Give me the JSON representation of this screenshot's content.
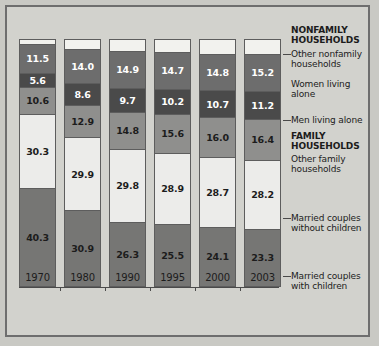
{
  "chart_data": {
    "type": "bar",
    "stacked": true,
    "title": "",
    "subtitle": "",
    "xlabel": "",
    "ylabel": "",
    "ylim": [
      0,
      100
    ],
    "grid": false,
    "legend_position": "right",
    "categories": [
      "1970",
      "1980",
      "1990",
      "1995",
      "2000",
      "2003"
    ],
    "top_labels": [
      "1.7",
      "3.6",
      "4.6",
      "5.0",
      "5.7",
      "5.6"
    ],
    "series": [
      {
        "name": "Married couples with children",
        "group": "FAMILY HOUSEHOLDS",
        "color": "#767674",
        "values": [
          40.3,
          30.9,
          26.3,
          25.5,
          24.1,
          23.3
        ],
        "labels": [
          "40.3",
          "30.9",
          "26.3",
          "25.5",
          "24.1",
          "23.3"
        ]
      },
      {
        "name": "Married couples without children",
        "group": "FAMILY HOUSEHOLDS",
        "color": "#ececea",
        "values": [
          30.3,
          29.9,
          29.8,
          28.9,
          28.7,
          28.2
        ],
        "labels": [
          "30.3",
          "29.9",
          "29.8",
          "28.9",
          "28.7",
          "28.2"
        ]
      },
      {
        "name": "Other family households",
        "group": "FAMILY HOUSEHOLDS",
        "color": "#8f8f8d",
        "values": [
          10.6,
          12.9,
          14.8,
          15.6,
          16.0,
          16.4
        ],
        "labels": [
          "10.6",
          "12.9",
          "14.8",
          "15.6",
          "16.0",
          "16.4"
        ]
      },
      {
        "name": "Men living alone",
        "group": "NONFAMILY HOUSEHOLDS",
        "color": "#4a4a4a",
        "values": [
          5.6,
          8.6,
          9.7,
          10.2,
          10.7,
          11.2
        ],
        "labels": [
          "5.6",
          "8.6",
          "9.7",
          "10.2",
          "10.7",
          "11.2"
        ]
      },
      {
        "name": "Women living alone",
        "group": "NONFAMILY HOUSEHOLDS",
        "color": "#6d6d6d",
        "values": [
          11.5,
          14.0,
          14.9,
          14.7,
          14.8,
          15.2
        ],
        "labels": [
          "11.5",
          "14.0",
          "14.9",
          "14.7",
          "14.8",
          "15.2"
        ]
      },
      {
        "name": "Other nonfamily households",
        "group": "NONFAMILY HOUSEHOLDS",
        "color": "#f2f2ee",
        "values": [
          1.7,
          3.6,
          4.6,
          5.0,
          5.7,
          5.6
        ],
        "labels": [
          "1.7",
          "3.6",
          "4.6",
          "5.0",
          "5.7",
          "5.6"
        ],
        "labels_outside": true
      }
    ]
  },
  "legend": {
    "nonfamily_heading_line1": "NONFAMILY",
    "nonfamily_heading_line2": "HOUSEHOLDS",
    "other_nonfamily_line1": "Other nonfamily",
    "other_nonfamily_line2": "households",
    "women_line1": "Women living",
    "women_line2": "alone",
    "men_line1": "Men living alone",
    "family_heading_line1": "FAMILY",
    "family_heading_line2": "HOUSEHOLDS",
    "other_family_line1": "Other family",
    "other_family_line2": "households",
    "married_without_line1": "Married couples",
    "married_without_line2": "without children",
    "married_with_line1": "Married couples",
    "married_with_line2": "with children"
  }
}
